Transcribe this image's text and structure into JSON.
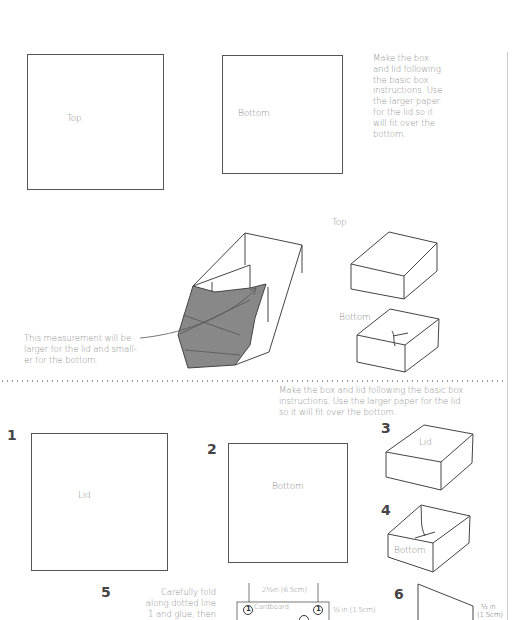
{
  "top_section": {
    "square_top_label": "Top",
    "square_bottom_label": "Bottom",
    "instructions": [
      "Make the box",
      "and lid following",
      "the basic box",
      "instructions. Use",
      "the larger paper",
      "for the lid so it",
      "will fit over the",
      "bottom."
    ],
    "box_top_label": "Top",
    "box_bottom_label": "Bottom",
    "measurement_note": [
      "This measurement will be",
      "larger for the lid and small-",
      "er for the bottom."
    ]
  },
  "bottom_section": {
    "instructions": [
      "Make the box and lid following the basic box",
      "instructions. Use the larger paper for the lid",
      "so it will fit over the bottom."
    ],
    "steps": [
      {
        "number": "1",
        "label": "Lid"
      },
      {
        "number": "2",
        "label": "Bottom"
      },
      {
        "number": "3",
        "label": "Lid"
      },
      {
        "number": "4",
        "label": "Bottom"
      },
      {
        "number": "5",
        "label": ""
      },
      {
        "number": "6",
        "label": ""
      }
    ],
    "step5_text": [
      "Carefully fold",
      "along dotted line",
      "1 and glue, then"
    ],
    "cardboard": {
      "width_label": "2½in (6.5cm)",
      "height_label": "½ in (1.5cm)",
      "material_label": "Cardboard",
      "marker": "1"
    },
    "step6_dim": [
      "½ in",
      "(1.5cm)"
    ]
  }
}
